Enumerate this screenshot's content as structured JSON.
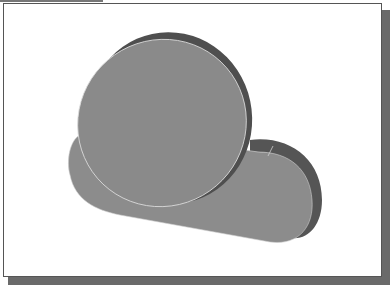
{
  "figure": {
    "colors": {
      "face": "#8a8a8a",
      "side": "#5a5a5a",
      "edge": "#d8d8d8",
      "frame_shadow": "#6a6a6a"
    }
  }
}
